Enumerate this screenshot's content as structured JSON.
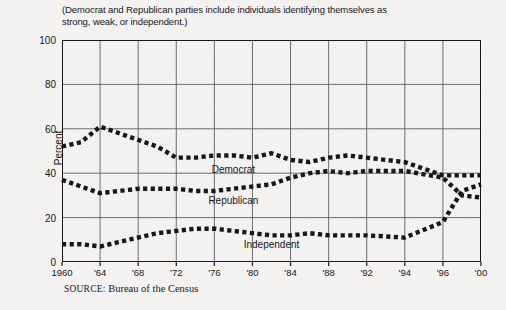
{
  "subtitle": "(Democrat and Republican parties include individuals identifying themselves as strong, weak, or independent.)",
  "source": {
    "label": "SOURCE:",
    "text": " Bureau of the Census"
  },
  "colors": {
    "ink": "#15171a",
    "grid": "#5a5f66",
    "paper": "#f3f2f0"
  },
  "chart_data": {
    "type": "line",
    "title": "",
    "subtitle": "(Democrat and Republican parties include individuals identifying themselves as strong, weak, or independent.)",
    "xlabel": "",
    "ylabel": "Percent",
    "ylim": [
      0,
      100
    ],
    "yticks": [
      0,
      20,
      40,
      60,
      80,
      100
    ],
    "grid": true,
    "legend_position": "inline-annotation",
    "x_tick_labels": [
      "1960",
      "'64",
      "'68",
      "'72",
      "'76",
      "'80",
      "'84",
      "'88",
      "'92",
      "'94",
      "'96",
      "'00"
    ],
    "x_tick_years": [
      1960,
      1964,
      1968,
      1972,
      1976,
      1980,
      1984,
      1988,
      1992,
      1994,
      1996,
      2000
    ],
    "x_axis_note": "tick spacing is uniform per label although 1992-1994-1996 are 2-year steps",
    "x": [
      1960,
      1962,
      1964,
      1966,
      1968,
      1970,
      1972,
      1974,
      1976,
      1978,
      1980,
      1982,
      1984,
      1986,
      1988,
      1990,
      1992,
      1994,
      1996,
      1998,
      2000
    ],
    "series": [
      {
        "name": "Democrat",
        "label": "Democrat",
        "marker": "square-dotted",
        "color": "#15171a",
        "values": [
          52,
          54,
          61,
          58,
          55,
          52,
          47,
          47,
          48,
          48,
          47,
          49,
          46,
          45,
          47,
          48,
          47,
          45,
          39,
          39,
          39
        ]
      },
      {
        "name": "Republican",
        "label": "Republican",
        "marker": "square-dotted",
        "color": "#15171a",
        "values": [
          37,
          34,
          31,
          32,
          33,
          33,
          33,
          32,
          32,
          33,
          34,
          35,
          38,
          40,
          41,
          40,
          41,
          41,
          38,
          30,
          29
        ]
      },
      {
        "name": "Independent",
        "label": "Independent",
        "marker": "square-dotted",
        "color": "#15171a",
        "values": [
          8,
          8,
          7,
          9,
          11,
          13,
          14,
          15,
          15,
          14,
          13,
          12,
          12,
          13,
          12,
          12,
          12,
          11,
          18,
          32,
          35
        ]
      }
    ],
    "annotations": [
      {
        "text": "Democrat",
        "x": 1978,
        "y": 42
      },
      {
        "text": "Republican",
        "x": 1978,
        "y": 28
      },
      {
        "text": "Independent",
        "x": 1982,
        "y": 8
      }
    ]
  }
}
